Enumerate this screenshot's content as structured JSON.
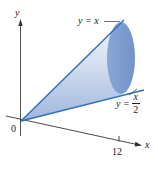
{
  "figure": {
    "type": "3d-solid-of-revolution",
    "axes": {
      "y_label": "y",
      "x_label": "x",
      "origin_label": "0",
      "x_tick_label": "12"
    },
    "curves": [
      {
        "id": "upper",
        "label_lhs": "y = x",
        "expr": "y = x"
      },
      {
        "id": "lower",
        "label_lhs": "y =",
        "numerator": "x",
        "denominator": "2",
        "expr": "y = x/2"
      }
    ],
    "colors": {
      "line": "#2f6fb8",
      "solid_light": "#e4ecf7",
      "solid_dark": "#8fa9d6",
      "end_cap": "#7f9fd2",
      "axis": "#333333"
    }
  }
}
